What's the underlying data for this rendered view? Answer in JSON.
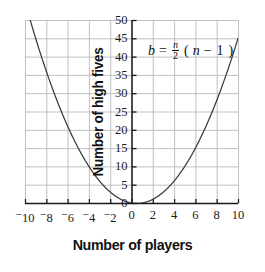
{
  "chart_data": {
    "type": "line",
    "title": "",
    "xlabel": "Number of players",
    "ylabel": "Number of high fives",
    "xlim": [
      -10,
      10
    ],
    "ylim": [
      0,
      50
    ],
    "grid": true,
    "legend": "none",
    "annotations": [
      {
        "name": "formula",
        "text": "b = n/2 (n - 1)",
        "parts": {
          "lhs": "b",
          "equals": "=",
          "frac_num": "n",
          "frac_den": "2",
          "open_paren": "(",
          "inner_var": "n",
          "minus": "−",
          "one": "1",
          "close_paren": ")"
        }
      }
    ],
    "x_ticks": [
      {
        "value": -10,
        "label": "10",
        "negative": true
      },
      {
        "value": -8,
        "label": "8",
        "negative": true
      },
      {
        "value": -6,
        "label": "6",
        "negative": true
      },
      {
        "value": -4,
        "label": "4",
        "negative": true
      },
      {
        "value": -2,
        "label": "2",
        "negative": true
      },
      {
        "value": 0,
        "label": "0",
        "negative": false
      },
      {
        "value": 2,
        "label": "2",
        "negative": false
      },
      {
        "value": 4,
        "label": "4",
        "negative": false
      },
      {
        "value": 6,
        "label": "6",
        "negative": false
      },
      {
        "value": 8,
        "label": "8",
        "negative": false
      },
      {
        "value": 10,
        "label": "10",
        "negative": false
      }
    ],
    "y_ticks": [
      {
        "value": 0,
        "label": "0"
      },
      {
        "value": 5,
        "label": "5"
      },
      {
        "value": 10,
        "label": "10"
      },
      {
        "value": 15,
        "label": "15"
      },
      {
        "value": 20,
        "label": "20"
      },
      {
        "value": 25,
        "label": "25"
      },
      {
        "value": 30,
        "label": "30"
      },
      {
        "value": 35,
        "label": "35"
      },
      {
        "value": 40,
        "label": "40"
      },
      {
        "value": 45,
        "label": "45"
      },
      {
        "value": 50,
        "label": "50"
      }
    ],
    "series": [
      {
        "name": "b = n/2 (n - 1)",
        "equation": "b = (n/2)(n - 1)",
        "x": [
          -10,
          -9.5,
          -9,
          -8.5,
          -8,
          -7.5,
          -7,
          -6.5,
          -6,
          -5.5,
          -5,
          -4.5,
          -4,
          -3.5,
          -3,
          -2.5,
          -2,
          -1.5,
          -1,
          -0.5,
          0,
          0.5,
          1,
          1.5,
          2,
          2.5,
          3,
          3.5,
          4,
          4.5,
          5,
          5.5,
          6,
          6.5,
          7,
          7.5,
          8,
          8.5,
          9,
          9.5,
          10
        ],
        "y": [
          55,
          49.875,
          45,
          40.375,
          36,
          31.875,
          28,
          24.375,
          21,
          17.875,
          15,
          12.375,
          10,
          7.875,
          6,
          4.375,
          3,
          1.875,
          1,
          0.375,
          0,
          -0.125,
          0,
          0.375,
          1,
          1.875,
          3,
          4.375,
          6,
          7.875,
          10,
          12.375,
          15,
          17.875,
          21,
          24.375,
          28,
          31.875,
          36,
          40.375,
          45
        ]
      }
    ],
    "colors": {
      "curve": "#3a3a3a",
      "grid": "#b9b9bd",
      "axis": "#1a1a1a",
      "text": "#111111",
      "background": "#ffffff"
    }
  }
}
